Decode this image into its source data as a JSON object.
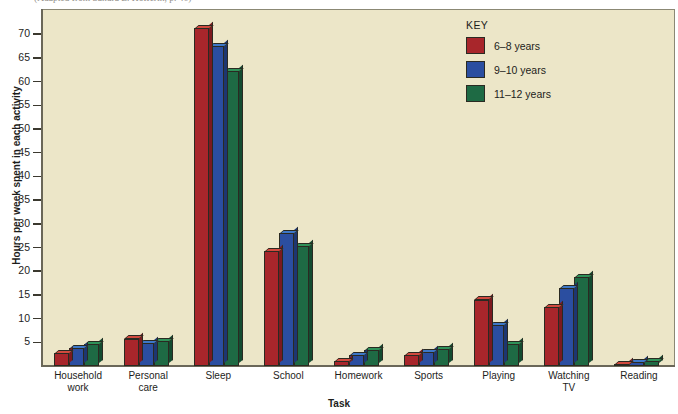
{
  "caption": {
    "text": "(Adapted from Sandra L. Hofferth, p. 46)"
  },
  "chart_data": {
    "type": "bar",
    "title": "",
    "xlabel": "Task",
    "ylabel": "Hours per week spent in each activity",
    "categories": [
      "Household\nwork",
      "Personal\ncare",
      "Sleep",
      "School",
      "Homework",
      "Sports",
      "Playing",
      "Watching\nTV",
      "Reading"
    ],
    "series": [
      {
        "name": "6–8 years",
        "color": "#a8262b",
        "values": [
          2.8,
          5.8,
          71.3,
          24.2,
          1.0,
          2.3,
          14.0,
          12.5,
          0.4
        ]
      },
      {
        "name": "9–10 years",
        "color": "#2b4ea0",
        "values": [
          3.8,
          4.9,
          67.5,
          28.0,
          2.3,
          3.0,
          8.7,
          16.5,
          0.8
        ]
      },
      {
        "name": "11–12 years",
        "color": "#1e6a44",
        "values": [
          4.6,
          5.3,
          62.2,
          25.3,
          3.3,
          3.6,
          4.6,
          18.7,
          1.0
        ]
      }
    ],
    "ylim": [
      0,
      73
    ],
    "yticks": [
      5,
      10,
      15,
      20,
      25,
      30,
      35,
      40,
      45,
      50,
      55,
      60,
      65,
      70
    ],
    "grid": false,
    "legend": {
      "title": "KEY",
      "position": "top-right"
    },
    "plot_background": "#ece6c8"
  }
}
